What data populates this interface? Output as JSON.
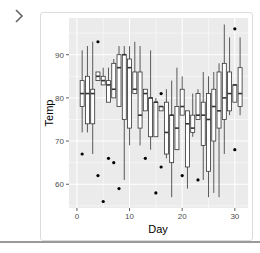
{
  "nav": {
    "back_icon": "chevron-right-icon"
  },
  "chart_data": {
    "type": "boxplot",
    "title": "",
    "xlabel": "Day",
    "ylabel": "Temp",
    "xlim": [
      -1.5,
      32.5
    ],
    "ylim": [
      54.5,
      98.5
    ],
    "xticks": [
      0,
      10,
      20,
      30
    ],
    "yticks": [
      60,
      70,
      80,
      90
    ],
    "grid": true,
    "theme": "ggplot2 grey",
    "colors": {
      "panel": "#ebebeb",
      "grid": "#ffffff",
      "box_fill": "#ffffff",
      "line": "#333333",
      "outlier": "#000000"
    },
    "boxes": [
      {
        "day": 1,
        "lo": 72,
        "q1": 78,
        "med": 81,
        "q3": 84,
        "hi": 91,
        "outliers": [
          67
        ]
      },
      {
        "day": 2,
        "lo": 72,
        "q1": 74,
        "med": 81,
        "q3": 85,
        "hi": 92,
        "outliers": []
      },
      {
        "day": 3,
        "lo": 67,
        "q1": 74,
        "med": 81,
        "q3": 82,
        "hi": 93,
        "outliers": []
      },
      {
        "day": 4,
        "lo": 84,
        "q1": 84,
        "med": 85,
        "q3": 86,
        "hi": 86,
        "outliers": [
          93,
          62
        ]
      },
      {
        "day": 5,
        "lo": 83,
        "q1": 83,
        "med": 84,
        "q3": 85,
        "hi": 87,
        "outliers": [
          56
        ]
      },
      {
        "day": 6,
        "lo": 79,
        "q1": 79,
        "med": 83,
        "q3": 84,
        "hi": 87,
        "outliers": [
          66
        ]
      },
      {
        "day": 7,
        "lo": 80,
        "q1": 80,
        "med": 82,
        "q3": 88,
        "hi": 89,
        "outliers": [
          65
        ]
      },
      {
        "day": 8,
        "lo": 78,
        "q1": 78,
        "med": 87,
        "q3": 90,
        "hi": 92,
        "outliers": [
          59
        ]
      },
      {
        "day": 9,
        "lo": 61,
        "q1": 75,
        "med": 90,
        "q3": 90,
        "hi": 92,
        "outliers": []
      },
      {
        "day": 10,
        "lo": 69,
        "q1": 73,
        "med": 87,
        "q3": 89,
        "hi": 92,
        "outliers": []
      },
      {
        "day": 11,
        "lo": 81,
        "q1": 81,
        "med": 82,
        "q3": 86,
        "hi": 93,
        "outliers": []
      },
      {
        "day": 12,
        "lo": 69,
        "q1": 73,
        "med": 76,
        "q3": 86,
        "hi": 92,
        "outliers": []
      },
      {
        "day": 13,
        "lo": 77,
        "q1": 77,
        "med": 81,
        "q3": 82,
        "hi": 82,
        "outliers": [
          66
        ]
      },
      {
        "day": 14,
        "lo": 68,
        "q1": 71,
        "med": 80,
        "q3": 80,
        "hi": 91,
        "outliers": []
      },
      {
        "day": 15,
        "lo": 71,
        "q1": 71,
        "med": 79,
        "q3": 79,
        "hi": 80,
        "outliers": [
          58
        ]
      },
      {
        "day": 16,
        "lo": 77,
        "q1": 77,
        "med": 78,
        "q3": 78,
        "hi": 78,
        "outliers": [
          81,
          64
        ]
      },
      {
        "day": 17,
        "lo": 66,
        "q1": 67,
        "med": 72,
        "q3": 79,
        "hi": 82,
        "outliers": []
      },
      {
        "day": 18,
        "lo": 57,
        "q1": 65,
        "med": 76,
        "q3": 76,
        "hi": 84,
        "outliers": []
      },
      {
        "day": 19,
        "lo": 68,
        "q1": 68,
        "med": 73,
        "q3": 78,
        "hi": 87,
        "outliers": []
      },
      {
        "day": 20,
        "lo": 76,
        "q1": 76,
        "med": 78,
        "q3": 82,
        "hi": 85,
        "outliers": [
          62
        ]
      },
      {
        "day": 21,
        "lo": 59,
        "q1": 64,
        "med": 74,
        "q3": 77,
        "hi": 77,
        "outliers": []
      },
      {
        "day": 22,
        "lo": 71,
        "q1": 72,
        "med": 73,
        "q3": 76,
        "hi": 81,
        "outliers": []
      },
      {
        "day": 23,
        "lo": 75,
        "q1": 75,
        "med": 76,
        "q3": 81,
        "hi": 82,
        "outliers": [
          61
        ]
      },
      {
        "day": 24,
        "lo": 61,
        "q1": 69,
        "med": 76,
        "q3": 79,
        "hi": 86,
        "outliers": []
      },
      {
        "day": 25,
        "lo": 57,
        "q1": 63,
        "med": 75,
        "q3": 81,
        "hi": 85,
        "outliers": []
      },
      {
        "day": 26,
        "lo": 58,
        "q1": 70,
        "med": 78,
        "q3": 82,
        "hi": 86,
        "outliers": []
      },
      {
        "day": 27,
        "lo": 57,
        "q1": 73,
        "med": 77,
        "q3": 86,
        "hi": 88,
        "outliers": []
      },
      {
        "day": 28,
        "lo": 67,
        "q1": 75,
        "med": 80,
        "q3": 88,
        "hi": 97,
        "outliers": []
      },
      {
        "day": 29,
        "lo": 76,
        "q1": 77,
        "med": 81,
        "q3": 86,
        "hi": 94,
        "outliers": []
      },
      {
        "day": 30,
        "lo": 79,
        "q1": 79,
        "med": 83,
        "q3": 83,
        "hi": 83,
        "outliers": [
          96,
          68
        ]
      },
      {
        "day": 31,
        "lo": 76,
        "q1": 78,
        "med": 81,
        "q3": 87,
        "hi": 94,
        "outliers": []
      }
    ]
  }
}
